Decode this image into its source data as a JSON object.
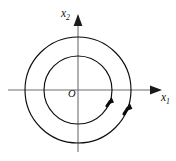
{
  "figure": {
    "background_color": "#ffffff",
    "width": 176,
    "height": 161
  },
  "axes": {
    "origin_label": "O",
    "origin_point": {
      "x": 78,
      "y": 90
    },
    "horizontal": {
      "name": "x1-axis",
      "label_base": "x",
      "label_sub": "1",
      "label_text": "x₁",
      "y": 90,
      "x_start": 8,
      "x_end": 160,
      "arrow_direction": "right",
      "color": "#6f6f6f"
    },
    "vertical": {
      "name": "x2-axis",
      "label_base": "x",
      "label_sub": "2",
      "label_text": "x₂",
      "x": 78,
      "y_start": 152,
      "y_end": 14,
      "arrow_direction": "up",
      "color": "#6f6f6f"
    }
  },
  "orbits": [
    {
      "name": "inner-orbit",
      "shape": "circle",
      "center": {
        "x": 78,
        "y": 90
      },
      "radius": 34,
      "stroke_color": "#0d0d0d",
      "direction": "clockwise",
      "arrow_angle_deg": 20,
      "x_axis_crossings": [
        44,
        112
      ],
      "y_axis_crossings": [
        56,
        124
      ]
    },
    {
      "name": "outer-orbit",
      "shape": "circle",
      "center": {
        "x": 78,
        "y": 90
      },
      "radius": 53,
      "stroke_color": "#0d0d0d",
      "direction": "clockwise",
      "arrow_angle_deg": 20,
      "x_axis_crossings": [
        25,
        131
      ],
      "y_axis_crossings": [
        37,
        143
      ]
    }
  ],
  "labels": {
    "x1": {
      "text": "x",
      "subscript": "1",
      "x": 163,
      "y": 98
    },
    "x2": {
      "text": "x",
      "subscript": "2",
      "x": 64,
      "y": 15
    },
    "origin": {
      "text": "O",
      "x": 70,
      "y": 96
    }
  },
  "colors": {
    "axis": "#6f6f6f",
    "curve": "#0d0d0d",
    "text": "#111111",
    "background": "#ffffff"
  }
}
